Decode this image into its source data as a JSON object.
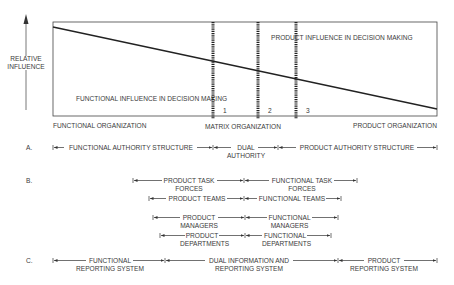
{
  "y_axis": {
    "label_line1": "RELATIVE",
    "label_line2": "INFLUENCE"
  },
  "chart_box": {
    "product_label": "PRODUCT INFLUENCE IN DECISION MAKING",
    "functional_label": "FUNCTIONAL INFLUENCE IN DECISION MAKING",
    "markers": [
      "1",
      "2",
      "3"
    ]
  },
  "x_axis": {
    "left": "FUNCTIONAL ORGANIZATION",
    "middle": "MATRIX ORGANIZATION",
    "right": "PRODUCT ORGANIZATION"
  },
  "section_a": {
    "letter": "A.",
    "spans": [
      {
        "line1": "FUNCTIONAL AUTHORITY STRUCTURE",
        "line2": ""
      },
      {
        "line1": "DUAL",
        "line2": "AUTHORITY"
      },
      {
        "line1": "PRODUCT AUTHORITY STRUCTURE",
        "line2": ""
      }
    ]
  },
  "section_b": {
    "letter": "B.",
    "rows": [
      {
        "left": {
          "line1": "PRODUCT TASK",
          "line2": "FORCES"
        },
        "right": {
          "line1": "FUNCTIONAL TASK",
          "line2": "FORCES"
        }
      },
      {
        "left": {
          "line1": "PRODUCT TEAMS",
          "line2": ""
        },
        "right": {
          "line1": "FUNCTIONAL TEAMS",
          "line2": ""
        }
      },
      {
        "left": {
          "line1": "PRODUCT",
          "line2": "MANAGERS"
        },
        "right": {
          "line1": "FUNCTIONAL",
          "line2": "MANAGERS"
        }
      },
      {
        "left": {
          "line1": "PRODUCT",
          "line2": "DEPARTMENTS"
        },
        "right": {
          "line1": "FUNCTIONAL",
          "line2": "DEPARTMENTS"
        }
      }
    ]
  },
  "section_c": {
    "letter": "C.",
    "spans": [
      {
        "line1": "FUNCTIONAL",
        "line2": "REPORTING SYSTEM"
      },
      {
        "line1": "DUAL INFORMATION AND",
        "line2": "REPORTING SYSTEM"
      },
      {
        "line1": "PRODUCT",
        "line2": "REPORTING SYSTEM"
      }
    ]
  },
  "colors": {
    "ink": "#333333",
    "background": "#ffffff"
  }
}
